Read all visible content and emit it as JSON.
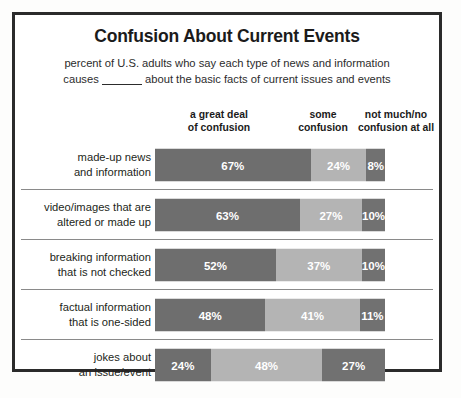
{
  "chart_data": {
    "type": "bar",
    "subtype": "stacked-horizontal-100",
    "title": "Confusion About Current Events",
    "subtitle_line1": "percent of U.S. adults who say each type of news and information",
    "subtitle_line2_before": "causes",
    "subtitle_line2_after": "about the basic facts of current issues and events",
    "xlabel": "",
    "ylabel": "",
    "grid": false,
    "legend_position": "top-as-column-headers",
    "column_headers": [
      {
        "line1": "a great deal",
        "line2": "of confusion"
      },
      {
        "line1": "some",
        "line2": "confusion"
      },
      {
        "line1": "not much/no",
        "line2": "confusion at all"
      }
    ],
    "series": [
      {
        "name": "a great deal of confusion",
        "color": "#6e6e6e",
        "values": [
          67,
          63,
          52,
          48,
          24
        ]
      },
      {
        "name": "some confusion",
        "color": "#b4b4b4",
        "values": [
          24,
          27,
          37,
          41,
          48
        ]
      },
      {
        "name": "not much/no confusion at all",
        "color": "#717171",
        "values": [
          8,
          10,
          10,
          11,
          27
        ]
      }
    ],
    "categories": [
      "made-up news and information",
      "video/images that are altered or made up",
      "breaking information that is not checked",
      "factual information that is one-sided",
      "jokes about an issue/event"
    ],
    "rows": [
      {
        "label_line1": "made-up news",
        "label_line2": "and information",
        "segments": [
          {
            "value": 67,
            "label": "67%"
          },
          {
            "value": 24,
            "label": "24%"
          },
          {
            "value": 8,
            "label": "8%"
          }
        ]
      },
      {
        "label_line1": "video/images that are",
        "label_line2": "altered or made up",
        "segments": [
          {
            "value": 63,
            "label": "63%"
          },
          {
            "value": 27,
            "label": "27%"
          },
          {
            "value": 10,
            "label": "10%"
          }
        ]
      },
      {
        "label_line1": "breaking information",
        "label_line2": "that is not checked",
        "segments": [
          {
            "value": 52,
            "label": "52%"
          },
          {
            "value": 37,
            "label": "37%"
          },
          {
            "value": 10,
            "label": "10%"
          }
        ]
      },
      {
        "label_line1": "factual information",
        "label_line2": "that is one-sided",
        "segments": [
          {
            "value": 48,
            "label": "48%"
          },
          {
            "value": 41,
            "label": "41%"
          },
          {
            "value": 11,
            "label": "11%"
          }
        ]
      },
      {
        "label_line1": "jokes about",
        "label_line2": "an issue/event",
        "segments": [
          {
            "value": 24,
            "label": "24%"
          },
          {
            "value": 48,
            "label": "48%"
          },
          {
            "value": 27,
            "label": "27%"
          }
        ]
      }
    ],
    "colors": {
      "great_deal": "#6e6e6e",
      "some": "#b4b4b4",
      "not_much": "#717171",
      "frame": "#2b2b2b",
      "separator": "#8a8a8a",
      "text": "#231f20",
      "background": "#ffffff"
    }
  }
}
